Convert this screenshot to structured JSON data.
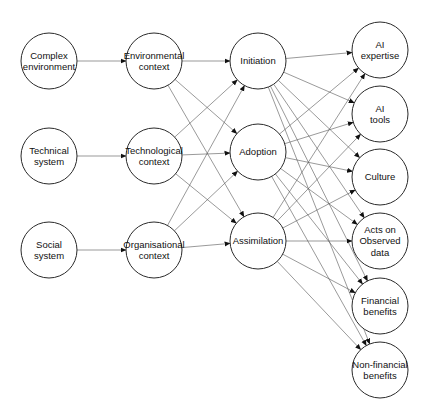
{
  "diagram": {
    "type": "flow",
    "columns": [
      {
        "id": "antecedents",
        "nodes": [
          {
            "id": "n1",
            "lines": [
              "Complex",
              "environment"
            ],
            "x": 49,
            "y": 61
          },
          {
            "id": "n2",
            "lines": [
              "Technical",
              "system"
            ],
            "x": 49,
            "y": 156
          },
          {
            "id": "n3",
            "lines": [
              "Social",
              "system"
            ],
            "x": 49,
            "y": 250
          }
        ]
      },
      {
        "id": "contexts",
        "nodes": [
          {
            "id": "n4",
            "lines": [
              "Environmental",
              "context"
            ],
            "x": 154,
            "y": 61
          },
          {
            "id": "n5",
            "lines": [
              "Technological",
              "context"
            ],
            "x": 154,
            "y": 156
          },
          {
            "id": "n6",
            "lines": [
              "Organisational",
              "context"
            ],
            "x": 154,
            "y": 250
          }
        ]
      },
      {
        "id": "stages",
        "nodes": [
          {
            "id": "n7",
            "lines": [
              "Initiation"
            ],
            "x": 258,
            "y": 61
          },
          {
            "id": "n8",
            "lines": [
              "Adoption"
            ],
            "x": 258,
            "y": 152
          },
          {
            "id": "n9",
            "lines": [
              "Assimilation"
            ],
            "x": 258,
            "y": 241
          }
        ]
      },
      {
        "id": "outcomes",
        "nodes": [
          {
            "id": "n10",
            "lines": [
              "AI",
              "expertise"
            ],
            "x": 380,
            "y": 50
          },
          {
            "id": "n11",
            "lines": [
              "AI",
              "tools"
            ],
            "x": 380,
            "y": 114
          },
          {
            "id": "n12",
            "lines": [
              "Culture"
            ],
            "x": 380,
            "y": 177
          },
          {
            "id": "n13",
            "lines": [
              "Acts on",
              "Observed",
              "data"
            ],
            "x": 380,
            "y": 241
          },
          {
            "id": "n14",
            "lines": [
              "Financial",
              "benefits"
            ],
            "x": 380,
            "y": 306
          },
          {
            "id": "n15",
            "lines": [
              "Non-financial",
              "benefits"
            ],
            "x": 380,
            "y": 370
          }
        ]
      }
    ],
    "radius": 28,
    "edges": [
      [
        "n1",
        "n4"
      ],
      [
        "n2",
        "n5"
      ],
      [
        "n3",
        "n6"
      ],
      [
        "n4",
        "n7"
      ],
      [
        "n4",
        "n8"
      ],
      [
        "n4",
        "n9"
      ],
      [
        "n5",
        "n7"
      ],
      [
        "n5",
        "n8"
      ],
      [
        "n5",
        "n9"
      ],
      [
        "n6",
        "n7"
      ],
      [
        "n6",
        "n8"
      ],
      [
        "n6",
        "n9"
      ],
      [
        "n7",
        "n10"
      ],
      [
        "n7",
        "n11"
      ],
      [
        "n7",
        "n12"
      ],
      [
        "n7",
        "n13"
      ],
      [
        "n7",
        "n14"
      ],
      [
        "n7",
        "n15"
      ],
      [
        "n8",
        "n10"
      ],
      [
        "n8",
        "n11"
      ],
      [
        "n8",
        "n12"
      ],
      [
        "n8",
        "n13"
      ],
      [
        "n8",
        "n14"
      ],
      [
        "n8",
        "n15"
      ],
      [
        "n9",
        "n10"
      ],
      [
        "n9",
        "n11"
      ],
      [
        "n9",
        "n12"
      ],
      [
        "n9",
        "n13"
      ],
      [
        "n9",
        "n14"
      ],
      [
        "n9",
        "n15"
      ]
    ],
    "colors": {
      "stroke": "#2a2a2a",
      "edge": "#555555",
      "background": "#ffffff"
    }
  }
}
